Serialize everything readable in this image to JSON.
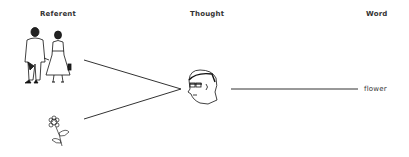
{
  "diagram": {
    "type": "semantic-triangle",
    "columns": {
      "referent": "Referent",
      "thought": "Thought",
      "word": "Word"
    },
    "nodes": [
      {
        "id": "couple",
        "kind": "illustration",
        "depicts": "man and woman walking hand in hand",
        "column": "referent"
      },
      {
        "id": "flower-drawing",
        "kind": "illustration",
        "depicts": "flower",
        "column": "referent"
      },
      {
        "id": "head",
        "kind": "illustration",
        "depicts": "man's head with glasses",
        "column": "thought"
      },
      {
        "id": "word-flower",
        "kind": "text",
        "text": "flower",
        "column": "word"
      }
    ],
    "edges": [
      {
        "from": "couple",
        "to": "head"
      },
      {
        "from": "flower-drawing",
        "to": "head"
      },
      {
        "from": "head",
        "to": "word-flower"
      }
    ]
  }
}
